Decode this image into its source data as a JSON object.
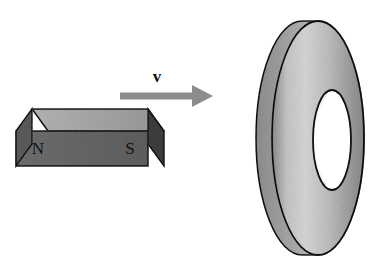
{
  "figure": {
    "background_color": "#ffffff",
    "width": 383,
    "height": 267
  },
  "magnet": {
    "name": "bar-magnet",
    "north_label": "N",
    "south_label": "S",
    "front_face_color": "#6a6a6a",
    "top_face_color": "#a9a9a9",
    "end_face_color": "#3d3d3d",
    "outline_color": "#111111",
    "label_color": "#111111",
    "bounds": {
      "x": 15,
      "y": 108,
      "width": 150,
      "height": 80
    }
  },
  "velocity_arrow": {
    "name": "velocity-arrow",
    "label": "v",
    "color": "#8c8c8c",
    "direction": "right",
    "shaft": {
      "x1": 120,
      "y1": 96,
      "x2": 196,
      "y2": 96,
      "thickness": 7
    },
    "head": {
      "tip_x": 213,
      "half_height": 11
    },
    "label_position": {
      "x": 157,
      "y": 78
    }
  },
  "ring": {
    "name": "conducting-ring",
    "shape": "annulus-disc-3d",
    "outer_face_color_light": "#d8d8d8",
    "outer_face_color_dark": "#8f8f8f",
    "rim_color": "#9a9a9a",
    "hole_color": "#ffffff",
    "outline_color": "#111111",
    "bounds": {
      "x": 262,
      "y": 20,
      "width": 104,
      "height": 236
    },
    "outer_ellipse": {
      "cx": 318,
      "cy": 138,
      "rx": 46,
      "ry": 117
    },
    "inner_hole_ellipse": {
      "cx": 332,
      "cy": 140,
      "rx": 19,
      "ry": 50
    },
    "depth_offset_x": -16
  }
}
